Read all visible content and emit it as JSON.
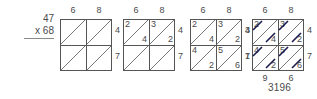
{
  "problem": {
    "multiplicand": "47",
    "multiplier": "x 68"
  },
  "labels": {
    "top_a": "6",
    "top_b": "8",
    "right_a": "4",
    "right_b": "7"
  },
  "grids": [
    {
      "name": "grid-empty",
      "top": [
        "6",
        "8"
      ],
      "right": [
        "4",
        "7"
      ],
      "left": [],
      "bottom": [],
      "cells": [
        {
          "upper": "",
          "lower": ""
        },
        {
          "upper": "",
          "lower": ""
        },
        {
          "upper": "",
          "lower": ""
        },
        {
          "upper": "",
          "lower": ""
        }
      ],
      "struck": false
    },
    {
      "name": "grid-top-row-filled",
      "top": [
        "6",
        "8"
      ],
      "right": [
        "4",
        "7"
      ],
      "left": [],
      "bottom": [],
      "cells": [
        {
          "upper": "2",
          "lower": "4"
        },
        {
          "upper": "3",
          "lower": "2"
        },
        {
          "upper": "",
          "lower": ""
        },
        {
          "upper": "",
          "lower": ""
        }
      ],
      "struck": false
    },
    {
      "name": "grid-all-filled",
      "top": [
        "6",
        "8"
      ],
      "right": [
        "4",
        "7"
      ],
      "left": [],
      "bottom": [],
      "cells": [
        {
          "upper": "2",
          "lower": "4"
        },
        {
          "upper": "3",
          "lower": "2"
        },
        {
          "upper": "4",
          "lower": "2"
        },
        {
          "upper": "5",
          "lower": "6"
        }
      ],
      "struck": false
    },
    {
      "name": "grid-diagonals-summed",
      "top": [
        "6",
        "8"
      ],
      "right": [
        "4",
        "7"
      ],
      "left": [
        "3",
        "1"
      ],
      "bottom": [
        "9",
        "6"
      ],
      "cells": [
        {
          "upper": "2",
          "lower": "4"
        },
        {
          "upper": "3",
          "lower": "2"
        },
        {
          "upper": "4",
          "lower": "2"
        },
        {
          "upper": "5",
          "lower": "6"
        }
      ],
      "struck": true
    }
  ],
  "answer": "3196",
  "colors": {
    "ink": "#4a4a4a",
    "rule": "#555555"
  }
}
